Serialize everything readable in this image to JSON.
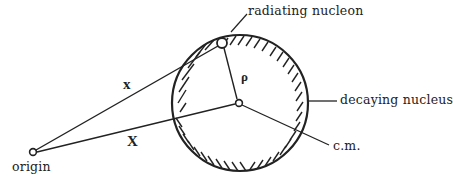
{
  "diagram": {
    "type": "physics-schematic",
    "labels": {
      "radiating_nucleon": "radiating nucleon",
      "decaying_nucleus": "decaying nucleus",
      "cm": "c.m.",
      "origin": "origin",
      "vec_x": "x",
      "vec_X": "X",
      "rho": "ρ"
    },
    "nodes": [
      {
        "id": "origin",
        "x": 33,
        "y": 152
      },
      {
        "id": "radiating_nucleon",
        "x": 222,
        "y": 43
      },
      {
        "id": "cm",
        "x": 239,
        "y": 103
      }
    ],
    "edges": [
      {
        "from": "origin",
        "to": "radiating_nucleon",
        "label": "x"
      },
      {
        "from": "origin",
        "to": "cm",
        "label": "X"
      },
      {
        "from": "cm",
        "to": "radiating_nucleon",
        "label": "ρ"
      }
    ],
    "nucleus": {
      "cx": 240,
      "cy": 103,
      "r": 68,
      "hatched": true
    },
    "colors": {
      "ink": "#222222",
      "background": "#ffffff"
    }
  }
}
